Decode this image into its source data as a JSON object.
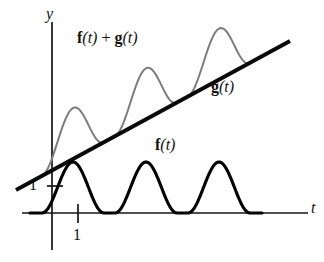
{
  "figure": {
    "kind": "math-function-plot",
    "background": "#ffffff",
    "width": 324,
    "height": 262
  },
  "axes": {
    "y_label": "y",
    "t_label": "t",
    "y_axis": {
      "x": 52,
      "y_top": 22,
      "y_bottom": 250
    },
    "t_axis": {
      "y": 213,
      "x_left": 22,
      "x_right": 308
    },
    "y_tick": {
      "label": "1",
      "y": 186,
      "x_start": 47,
      "x_end": 63,
      "label_x": 29,
      "label_y": 177
    },
    "t_tick": {
      "label": "1",
      "x": 78,
      "y_start": 204,
      "y_end": 223,
      "label_x": 73,
      "label_y": 227
    },
    "y_label_pos": {
      "x": 46,
      "y": 6
    },
    "t_label_pos": {
      "x": 311,
      "y": 200
    }
  },
  "labels": {
    "sum_curve": {
      "bold_f": "f",
      "arg": "(t)",
      "plus": " + ",
      "bold_g": "g",
      "x": 77,
      "y": 30
    },
    "g_curve": {
      "bold": "g",
      "arg": "(t)",
      "x": 211,
      "y": 79
    },
    "f_curve": {
      "bold": "f",
      "arg": "(t)",
      "x": 155,
      "y": 137
    }
  },
  "colors": {
    "f_curve": "#000000",
    "sum_curve": "#7d7d7d",
    "g_line": "#0a0a0a",
    "axis": "#151515",
    "text": "#111111"
  },
  "chart_data": {
    "type": "line",
    "title": "",
    "xlabel": "t",
    "ylabel": "y",
    "grid": false,
    "legend": "inline-annotations",
    "xlim": [
      0,
      10
    ],
    "ylim": [
      0,
      9
    ],
    "annotations": [
      "f(t) + g(t)",
      "g(t)",
      "f(t)"
    ],
    "tick_labels": {
      "x": [
        "1"
      ],
      "y": [
        "1"
      ]
    },
    "series": [
      {
        "name": "f(t)",
        "description": "three raised-cosine bumps of unit-like amplitude resting on the t-axis",
        "color": "#000000",
        "style": "thick-black",
        "baseline_y_px": 213,
        "peak_y_px": 162,
        "bump_peaks_px": [
          73,
          146,
          219
        ],
        "start_x_px": 30,
        "end_x_px": 262,
        "period_px": 73,
        "bump_half_width_px": 31
      },
      {
        "name": "g(t)",
        "description": "straight line of positive slope",
        "color": "#0a0a0a",
        "style": "thick-black-straight",
        "x0_px": 16,
        "y0_px": 190,
        "x1_px": 290,
        "y1_px": 41
      },
      {
        "name": "f(t) + g(t)",
        "description": "gray curve: the line plus the three bumps, riding above g(t)",
        "color": "#7d7d7d",
        "style": "thin-gray",
        "start_x_px": 37,
        "end_x_px": 262,
        "peaks_px": [
          [
            73,
            104
          ],
          [
            146,
            64
          ],
          [
            219,
            24
          ]
        ]
      }
    ]
  }
}
